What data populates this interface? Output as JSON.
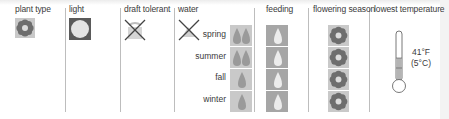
{
  "columns": [
    {
      "key": "plant_type",
      "label": "plant type",
      "icon": "flower-icon"
    },
    {
      "key": "light",
      "label": "light",
      "icon": "sun-icon"
    },
    {
      "key": "draft_tolerant",
      "label": "draft tolerant",
      "icon": "draft-crossed-icon",
      "value": "no"
    },
    {
      "key": "water",
      "label": "water",
      "icon": "water-crossed-icon"
    },
    {
      "key": "feeding",
      "label": "feeding",
      "icon": "drop-icon"
    },
    {
      "key": "flowering_season",
      "label": "flowering season",
      "icon": "flower-icon"
    },
    {
      "key": "lowest_temperature",
      "label": "lowest temperature",
      "icon": "thermometer-icon"
    }
  ],
  "seasons": [
    {
      "label": "spring",
      "water_drops": 2,
      "feeding_drops": 1,
      "flowering": true
    },
    {
      "label": "summer",
      "water_drops": 2,
      "feeding_drops": 1,
      "flowering": true
    },
    {
      "label": "fall",
      "water_drops": 1,
      "feeding_drops": 1,
      "flowering": true
    },
    {
      "label": "winter",
      "water_drops": 1,
      "feeding_drops": 1,
      "flowering": true
    }
  ],
  "lowest_temperature": {
    "fahrenheit": "41°F",
    "celsius": "(5°C)"
  },
  "colors": {
    "tile": "#c9c9c9",
    "icon_dark": "#6e6e6e",
    "icon_light": "#e2e2e2",
    "separator": "#bdbdbd"
  }
}
